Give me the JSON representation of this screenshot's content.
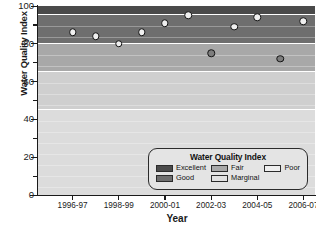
{
  "chart_data": {
    "type": "scatter",
    "title": "",
    "xlabel": "Year",
    "ylabel": "Water Quality Index",
    "ylim": [
      0,
      100
    ],
    "yticks": [
      0,
      20,
      40,
      60,
      80,
      100
    ],
    "ytick_labels": [
      "0",
      "20",
      "40",
      "60",
      "80",
      "100"
    ],
    "grid": false,
    "legend_position": "bottom-right",
    "legend_title": "Water Quality Index",
    "categories": [
      "1995-96",
      "1996-97",
      "1997-98",
      "1998-99",
      "1999-00",
      "2000-01",
      "2001-02",
      "2002-03",
      "2003-04",
      "2004-05",
      "2005-06",
      "2006-07"
    ],
    "xtick_labels": [
      "1996-97",
      "1998-99",
      "2000-01",
      "2002-03",
      "2004-05",
      "2006-07"
    ],
    "series": [
      {
        "name": "Water Quality Index",
        "points": [
          {
            "x": "1996-97",
            "y": 86,
            "style": "open"
          },
          {
            "x": "1997-98",
            "y": 84,
            "style": "open"
          },
          {
            "x": "1998-99",
            "y": 80,
            "style": "open"
          },
          {
            "x": "1999-00",
            "y": 86,
            "style": "open"
          },
          {
            "x": "2000-01",
            "y": 91,
            "style": "open"
          },
          {
            "x": "2001-02",
            "y": 95,
            "style": "open"
          },
          {
            "x": "2002-03",
            "y": 75,
            "style": "filled"
          },
          {
            "x": "2003-04",
            "y": 89,
            "style": "open"
          },
          {
            "x": "2004-05",
            "y": 94,
            "style": "open"
          },
          {
            "x": "2005-06",
            "y": 72,
            "style": "filled"
          },
          {
            "x": "2006-07",
            "y": 92,
            "style": "open"
          }
        ]
      }
    ],
    "bands": [
      {
        "label": "Excellent",
        "min": 95,
        "max": 100,
        "color": "#4a4a4a"
      },
      {
        "label": "Good",
        "min": 80,
        "max": 94,
        "color": "#6e6e6e"
      },
      {
        "label": "Fair",
        "min": 65,
        "max": 79,
        "color": "#a8a8a8"
      },
      {
        "label": "Marginal",
        "min": 45,
        "max": 64,
        "color": "#cfcfcf"
      },
      {
        "label": "Poor",
        "min": 0,
        "max": 44,
        "color": "#dcdcdc"
      }
    ],
    "legend_entries": [
      {
        "label": "Excellent",
        "color": "#4a4a4a"
      },
      {
        "label": "Good",
        "color": "#6e6e6e"
      },
      {
        "label": "Fair",
        "color": "#a8a8a8"
      },
      {
        "label": "Marginal",
        "color": "#e2e2e2"
      },
      {
        "label": "Poor",
        "color": "#eeeeee"
      }
    ]
  }
}
